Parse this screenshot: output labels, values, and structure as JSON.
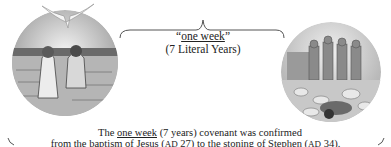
{
  "diagram": {
    "bracket_label": {
      "quote_open": "“",
      "term": "one week",
      "quote_close": "”",
      "subtitle": "(7 Literal Years)"
    },
    "caption": {
      "line1_pre": "The ",
      "line1_term": "one week",
      "line1_post": " (7 years) covenant was confirmed",
      "line2_pre": "from the baptism of Jesus (",
      "line2_era1": "AD",
      "line2_mid1": " 27) to the stoning of Stephen (",
      "line2_era2": "AD",
      "line2_post": " 34)."
    },
    "illustrations": {
      "left": "baptism-of-jesus-illustration",
      "right": "stoning-of-stephen-illustration"
    },
    "colors": {
      "line": "#555555",
      "text": "#222222"
    }
  }
}
